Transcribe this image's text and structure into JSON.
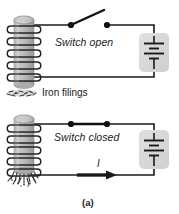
{
  "figure": {
    "caption": "(a)",
    "panels": [
      {
        "id": "switch-open",
        "switch_label": "Switch open",
        "switch_state": "open",
        "filings_label": "Iron filings",
        "filings_state": "scattered-loose",
        "current_label": "",
        "current_flowing": false
      },
      {
        "id": "switch-closed",
        "switch_label": "Switch closed",
        "switch_state": "closed",
        "filings_label": "",
        "filings_state": "clinging-to-core",
        "current_label": "I",
        "current_flowing": true
      }
    ],
    "components": {
      "solenoid_name": "solenoid-coil",
      "battery_name": "battery-symbol",
      "wire_name": "circuit-wire"
    },
    "colors": {
      "background": "#ffffff",
      "wire": "#1a1a1a",
      "core_fill": "#b8b8b8",
      "core_top": "#cccccc",
      "coil_stroke": "#2b2b2b",
      "battery_box": "#d9d9d9",
      "text": "#1a1a1a",
      "filings": "#3a3a3a"
    }
  }
}
